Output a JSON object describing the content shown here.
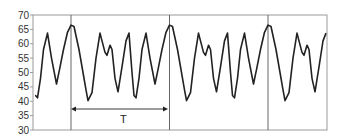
{
  "chart_data": {
    "type": "line",
    "title": "",
    "xlabel": "",
    "ylabel": "",
    "ylim": [
      30,
      70
    ],
    "yticks": [
      30,
      35,
      40,
      45,
      50,
      55,
      60,
      65,
      70
    ],
    "grid": false,
    "legend": null,
    "period_marker": {
      "label": "T",
      "description": "double-headed arrow spanning one period between vertical lines"
    },
    "vertical_lines_at_period_boundaries": 3,
    "period_pattern": [
      [
        0,
        66.5
      ],
      [
        3,
        66
      ],
      [
        8,
        58
      ],
      [
        12,
        50
      ],
      [
        15,
        44
      ],
      [
        17,
        40.2
      ],
      [
        21,
        43
      ],
      [
        25,
        55
      ],
      [
        29,
        63.7
      ],
      [
        31,
        61
      ],
      [
        34,
        57
      ],
      [
        36,
        56
      ],
      [
        39,
        59.5
      ],
      [
        41,
        58
      ],
      [
        44,
        48
      ],
      [
        47,
        43.3
      ],
      [
        51,
        52
      ],
      [
        55,
        61
      ],
      [
        58,
        63.7
      ],
      [
        61,
        50
      ],
      [
        63,
        42
      ],
      [
        65,
        41.2
      ],
      [
        68,
        48
      ],
      [
        71,
        58
      ],
      [
        75,
        63.7
      ],
      [
        79,
        55
      ],
      [
        84,
        46
      ],
      [
        87,
        51
      ],
      [
        91,
        58
      ],
      [
        95,
        64
      ]
    ],
    "series": [
      {
        "name": "signal",
        "color": "#222222",
        "values": [
          42,
          41.2,
          48,
          58,
          63.7,
          55,
          46,
          51,
          58,
          64,
          66.5,
          66,
          58,
          50,
          44,
          40.2,
          43,
          55,
          63.7,
          61,
          57,
          56,
          59.5,
          58,
          48,
          43.3,
          52,
          61,
          63.7,
          50,
          42,
          41.2,
          48,
          58,
          63.7,
          55,
          46,
          51,
          58,
          64,
          66.5,
          66,
          58,
          50,
          44,
          40.2,
          43,
          55,
          63.7,
          61,
          57,
          56,
          59.5,
          58,
          48,
          43.3,
          52,
          61,
          63.7,
          50,
          42,
          41.2,
          48,
          58,
          63.7,
          55,
          46,
          51,
          58,
          64,
          66.5,
          66,
          58,
          50,
          44,
          40.2,
          43,
          55,
          63.7,
          61,
          57,
          56,
          59.5,
          58,
          48,
          43.3,
          52,
          61,
          63.7
        ]
      }
    ]
  },
  "axis": {
    "y_labels": [
      "70",
      "65",
      "60",
      "55",
      "50",
      "45",
      "40",
      "35",
      "30"
    ]
  },
  "annotation": {
    "period_label": "T"
  },
  "colors": {
    "line": "#222222",
    "frame": "#9a9a9a",
    "vline": "#555555"
  }
}
